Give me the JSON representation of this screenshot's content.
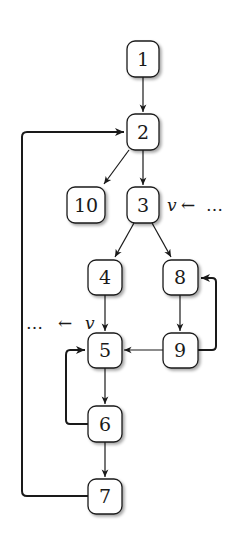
{
  "diagram": {
    "colors": {
      "stroke": "#1a1a1a",
      "fill": "#ffffff",
      "shadow": "#9a9a9a"
    },
    "nodes": [
      {
        "id": "1",
        "label": "1",
        "x": 127,
        "y": 41,
        "w": 32,
        "h": 36
      },
      {
        "id": "2",
        "label": "2",
        "x": 127,
        "y": 114,
        "w": 32,
        "h": 36
      },
      {
        "id": "10",
        "label": "10",
        "x": 67,
        "y": 187,
        "w": 38,
        "h": 36
      },
      {
        "id": "3",
        "label": "3",
        "x": 127,
        "y": 187,
        "w": 32,
        "h": 36
      },
      {
        "id": "4",
        "label": "4",
        "x": 88,
        "y": 260,
        "w": 34,
        "h": 35
      },
      {
        "id": "8",
        "label": "8",
        "x": 163,
        "y": 260,
        "w": 35,
        "h": 35
      },
      {
        "id": "5",
        "label": "5",
        "x": 88,
        "y": 333,
        "w": 34,
        "h": 35
      },
      {
        "id": "9",
        "label": "9",
        "x": 163,
        "y": 333,
        "w": 35,
        "h": 35
      },
      {
        "id": "6",
        "label": "6",
        "x": 88,
        "y": 406,
        "w": 34,
        "h": 36
      },
      {
        "id": "7",
        "label": "7",
        "x": 88,
        "y": 479,
        "w": 34,
        "h": 35
      }
    ],
    "edges": [
      {
        "from": "1",
        "to": "2"
      },
      {
        "from": "2",
        "to": "10"
      },
      {
        "from": "2",
        "to": "3"
      },
      {
        "from": "3",
        "to": "4"
      },
      {
        "from": "3",
        "to": "8"
      },
      {
        "from": "4",
        "to": "5"
      },
      {
        "from": "8",
        "to": "9"
      },
      {
        "from": "9",
        "to": "5"
      },
      {
        "from": "9",
        "to": "8",
        "type": "back-edge"
      },
      {
        "from": "5",
        "to": "6"
      },
      {
        "from": "6",
        "to": "5",
        "type": "back-edge"
      },
      {
        "from": "6",
        "to": "7"
      },
      {
        "from": "7",
        "to": "2",
        "type": "back-edge"
      }
    ],
    "annotations": {
      "node3": {
        "var": "v",
        "arrow": "←",
        "dots": "…"
      },
      "node5": {
        "dots": "…",
        "arrow": "←",
        "var": "v"
      }
    }
  }
}
